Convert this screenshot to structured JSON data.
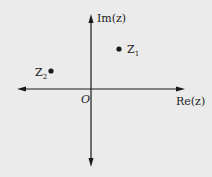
{
  "diagram": {
    "type": "argand-plane",
    "background": "#ebebeb",
    "axis_color": "#1a1a1a",
    "axes": {
      "vertical_label": "Im(z)",
      "horizontal_label": "Re(z)",
      "origin_label": "O"
    },
    "points": [
      {
        "name": "Z",
        "subscript": "1",
        "quadrant": "I"
      },
      {
        "name": "Z",
        "subscript": "2",
        "quadrant": "II"
      }
    ]
  }
}
